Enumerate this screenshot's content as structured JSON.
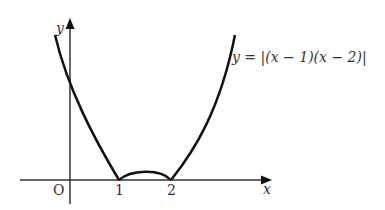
{
  "diagram": {
    "type": "function-graph",
    "equation_label": "y = |(x − 1)(x − 2)|",
    "axes": {
      "x_label": "x",
      "y_label": "y",
      "origin_label": "O"
    },
    "ticks": [
      {
        "label": "1",
        "value": 1
      },
      {
        "label": "2",
        "value": 2
      }
    ],
    "colors": {
      "curve": "#111111",
      "axis": "#333333",
      "text": "#333333"
    }
  }
}
